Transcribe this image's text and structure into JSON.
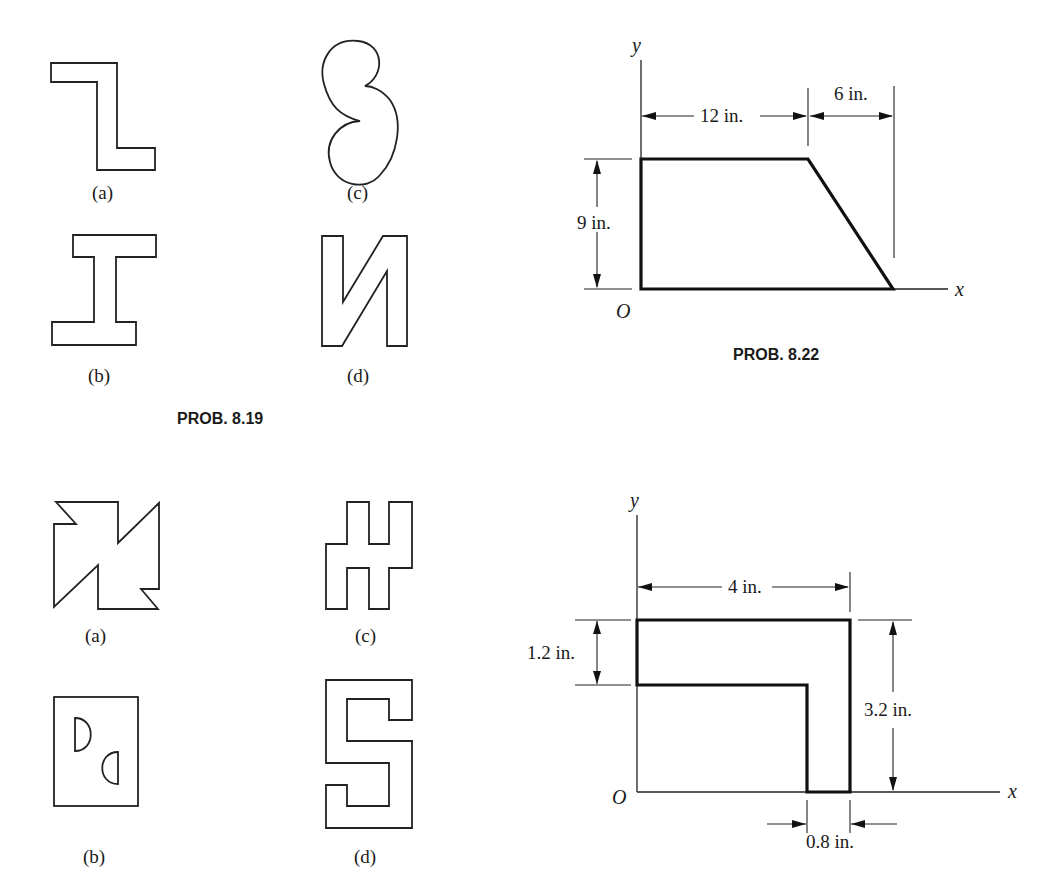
{
  "problems": [
    {
      "id": "prob-8-19",
      "caption": "PROB. 8.19",
      "figures": [
        {
          "label": "(a)",
          "shape": "Z-shaped step outline"
        },
        {
          "label": "(b)",
          "shape": "I-beam outline"
        },
        {
          "label": "(c)",
          "shape": "curved kidney / cardioid-like outline"
        },
        {
          "label": "(d)",
          "shape": "mirrored N outline"
        }
      ]
    },
    {
      "id": "prob-8-22",
      "caption": "PROB. 8.22",
      "axes": {
        "x": "x",
        "y": "y",
        "origin": "O"
      },
      "dimensions": {
        "top_width": "12 in.",
        "slope_run": "6 in.",
        "height": "9 in."
      }
    },
    {
      "id": "prob-8-20",
      "figures": [
        {
          "label": "(a)",
          "shape": "pinwheel outline"
        },
        {
          "label": "(b)",
          "shape": "rectangle with two semicircular cutouts"
        },
        {
          "label": "(c)",
          "shape": "H-like stepped outline"
        },
        {
          "label": "(d)",
          "shape": "S-shaped stepped outline"
        }
      ]
    },
    {
      "id": "prob-8-23",
      "axes": {
        "x": "x",
        "y": "y",
        "origin": "O"
      },
      "dimensions": {
        "width": "4 in.",
        "flange_thickness": "1.2 in.",
        "height": "3.2 in.",
        "web_thickness": "0.8 in."
      }
    }
  ]
}
